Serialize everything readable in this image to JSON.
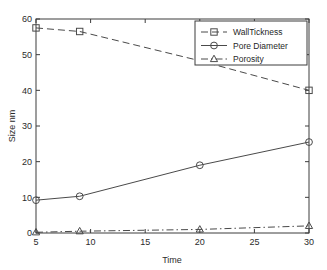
{
  "chart_data": {
    "type": "line",
    "title": "",
    "xlabel": "Time",
    "ylabel": "Size nm",
    "x": [
      5,
      9,
      20,
      30
    ],
    "xlim": [
      5,
      30
    ],
    "ylim": [
      0,
      60
    ],
    "xticks": [
      5,
      10,
      15,
      20,
      25,
      30
    ],
    "yticks": [
      0,
      10,
      20,
      30,
      40,
      50,
      60
    ],
    "xtick_labels": [
      "5",
      "10",
      "15",
      "20",
      "25",
      "30"
    ],
    "ytick_labels": [
      "0",
      "10",
      "20",
      "30",
      "40",
      "50",
      "60"
    ],
    "grid": false,
    "legend_position": "upper right",
    "series": [
      {
        "name": "WallTickness",
        "values": [
          57.5,
          56.5,
          48.3,
          40.0
        ],
        "marker": "square",
        "linestyle": "dashed",
        "color": "#4a4a4a"
      },
      {
        "name": "Pore Diameter",
        "values": [
          9.2,
          10.3,
          19.0,
          25.5
        ],
        "marker": "circle",
        "linestyle": "solid",
        "color": "#4a4a4a"
      },
      {
        "name": "Porosity",
        "values": [
          0.2,
          0.5,
          1.0,
          2.0
        ],
        "marker": "triangle",
        "linestyle": "dashdot",
        "color": "#4a4a4a"
      }
    ]
  },
  "axes": {
    "x_title": "Time",
    "y_title": "Size nm"
  },
  "legend": {
    "entries": [
      {
        "label": "WallTickness"
      },
      {
        "label": "Pore Diameter"
      },
      {
        "label": "Porosity"
      }
    ]
  },
  "colors": {
    "axis": "#3d3d3d",
    "line": "#4a4a4a",
    "background": "#ffffff",
    "text": "#2b2b2b"
  }
}
